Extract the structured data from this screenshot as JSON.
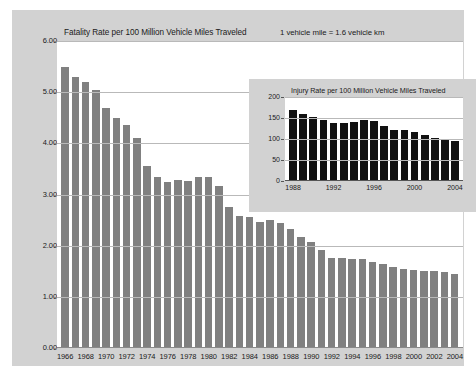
{
  "chart_data": [
    {
      "id": "fatality",
      "type": "bar",
      "title": "Fatality Rate per 100 Million Vehicle Miles Traveled",
      "annotation": "1 vehicle mile = 1.6 vehicle km",
      "xlabel": "",
      "ylabel": "",
      "ylim": [
        0,
        6
      ],
      "yticks": [
        "0.00",
        "1.00",
        "2.00",
        "3.00",
        "4.00",
        "5.00",
        "6.00"
      ],
      "ytick_values": [
        0,
        1,
        2,
        3,
        4,
        5,
        6
      ],
      "grid": true,
      "legend": "none",
      "bar_color": "#808080",
      "categories": [
        1966,
        1967,
        1968,
        1969,
        1970,
        1971,
        1972,
        1973,
        1974,
        1975,
        1976,
        1977,
        1978,
        1979,
        1980,
        1981,
        1982,
        1983,
        1984,
        1985,
        1986,
        1987,
        1988,
        1989,
        1990,
        1991,
        1992,
        1993,
        1994,
        1995,
        1996,
        1997,
        1998,
        1999,
        2000,
        2001,
        2002,
        2003,
        2004
      ],
      "values": [
        5.5,
        5.3,
        5.2,
        5.05,
        4.7,
        4.5,
        4.35,
        4.1,
        3.55,
        3.35,
        3.25,
        3.28,
        3.27,
        3.35,
        3.35,
        3.17,
        2.76,
        2.58,
        2.57,
        2.47,
        2.51,
        2.44,
        2.32,
        2.17,
        2.08,
        1.91,
        1.75,
        1.75,
        1.73,
        1.73,
        1.69,
        1.64,
        1.58,
        1.55,
        1.53,
        1.51,
        1.51,
        1.48,
        1.44
      ],
      "xtick_labels": [
        "1966",
        "1968",
        "1970",
        "1972",
        "1974",
        "1976",
        "1978",
        "1980",
        "1982",
        "1984",
        "1986",
        "1988",
        "1990",
        "1992",
        "1994",
        "1996",
        "1998",
        "2000",
        "2002",
        "2004"
      ],
      "xtick_categories": [
        1966,
        1968,
        1970,
        1972,
        1974,
        1976,
        1978,
        1980,
        1982,
        1984,
        1986,
        1988,
        1990,
        1992,
        1994,
        1996,
        1998,
        2000,
        2002,
        2004
      ]
    },
    {
      "id": "injury",
      "type": "bar",
      "title": "Injury Rate per 100 Million Vehicle Miles Traveled",
      "xlabel": "",
      "ylabel": "",
      "ylim": [
        0,
        200
      ],
      "yticks": [
        "0",
        "50",
        "100",
        "150",
        "200"
      ],
      "ytick_values": [
        0,
        50,
        100,
        150,
        200
      ],
      "grid": true,
      "legend": "none",
      "bar_color": "#111111",
      "categories": [
        1988,
        1989,
        1990,
        1991,
        1992,
        1993,
        1994,
        1995,
        1996,
        1997,
        1998,
        1999,
        2000,
        2001,
        2002,
        2003,
        2004
      ],
      "values": [
        170,
        159,
        153,
        145,
        138,
        138,
        141,
        145,
        142,
        131,
        121,
        121,
        116,
        109,
        102,
        100,
        95
      ],
      "xtick_labels": [
        "1988",
        "1992",
        "1996",
        "2000",
        "2004"
      ],
      "xtick_categories": [
        1988,
        1992,
        1996,
        2000,
        2004
      ]
    }
  ],
  "colors": {
    "panel_background": "#d2d2d2",
    "plot_background": "#ffffff",
    "gridline": "#b9b9b9",
    "main_bar": "#808080",
    "inset_bar": "#111111",
    "text": "#1a1a1a"
  }
}
